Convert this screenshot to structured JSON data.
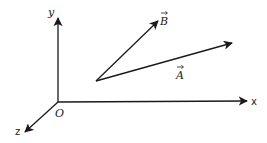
{
  "diagram": {
    "type": "3d-coordinate-axes-with-vectors",
    "colors": {
      "line": "#1a1a1a",
      "text": "#222222",
      "background": "#ffffff"
    },
    "origin": {
      "label": "O",
      "x": 58,
      "y": 102
    },
    "axes": [
      {
        "name": "y",
        "label": "y",
        "from": [
          58,
          102
        ],
        "to": [
          58,
          18
        ],
        "label_pos": [
          48,
          16
        ]
      },
      {
        "name": "x",
        "label": "x",
        "from": [
          58,
          102
        ],
        "to": [
          247,
          101
        ],
        "label_pos": [
          251,
          105
        ]
      },
      {
        "name": "z",
        "label": "z",
        "from": [
          58,
          102
        ],
        "to": [
          25,
          132
        ],
        "label_pos": [
          15,
          135
        ]
      }
    ],
    "vectors": [
      {
        "name": "B",
        "label": "B",
        "from": [
          96,
          81
        ],
        "to": [
          158,
          21
        ],
        "label_pos": [
          160,
          23
        ]
      },
      {
        "name": "A",
        "label": "A",
        "from": [
          96,
          81
        ],
        "to": [
          232,
          43
        ],
        "label_pos": [
          176,
          77
        ]
      }
    ]
  }
}
